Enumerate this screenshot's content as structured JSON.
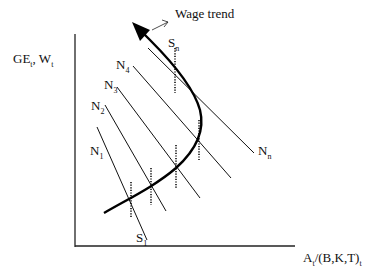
{
  "diagram": {
    "y_axis_label": {
      "main": "GE",
      "sub1": "t",
      "sep": ", W",
      "sub2": "t"
    },
    "x_axis_label": {
      "main": "A",
      "sub1": "t",
      "mid": "/(B,K,T)",
      "sub2": "t"
    },
    "trend_label": "Wage trend",
    "curves": [
      {
        "name": "N",
        "sub": "1"
      },
      {
        "name": "N",
        "sub": "2"
      },
      {
        "name": "N",
        "sub": "3"
      },
      {
        "name": "N",
        "sub": "4"
      },
      {
        "name": "N",
        "sub": "n"
      }
    ],
    "supply_labels": [
      {
        "name": "S",
        "sub": "1"
      },
      {
        "name": "S",
        "sub": "n"
      }
    ]
  }
}
